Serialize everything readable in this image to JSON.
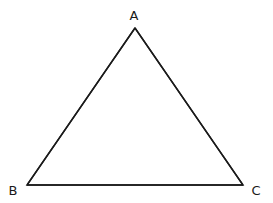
{
  "diagram": {
    "type": "triangle",
    "stroke_color": "#1a1a1a",
    "background": "#ffffff",
    "vertices": [
      {
        "label": "A",
        "x": 135,
        "y": 28,
        "label_x": 134,
        "label_y": 20
      },
      {
        "label": "B",
        "x": 27,
        "y": 185,
        "label_x": 13,
        "label_y": 195
      },
      {
        "label": "C",
        "x": 243,
        "y": 185,
        "label_x": 256,
        "label_y": 195
      }
    ],
    "edges": [
      {
        "from": "A",
        "to": "B"
      },
      {
        "from": "B",
        "to": "C"
      },
      {
        "from": "C",
        "to": "A"
      }
    ]
  }
}
